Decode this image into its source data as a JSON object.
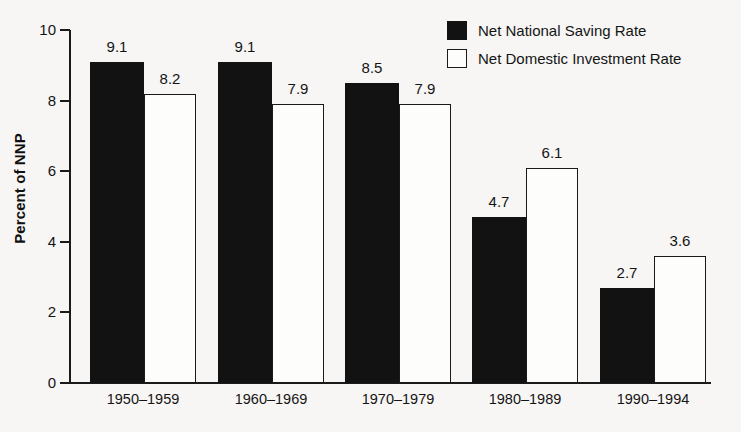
{
  "chart_data": {
    "type": "bar",
    "title": "",
    "xlabel": "",
    "ylabel": "Percent of NNP",
    "ylim": [
      0,
      10
    ],
    "yticks": [
      0,
      2,
      4,
      6,
      8,
      10
    ],
    "grid": false,
    "legend_position": "top-right",
    "categories": [
      "1950–1959",
      "1960–1969",
      "1970–1979",
      "1980–1989",
      "1990–1994"
    ],
    "series": [
      {
        "name": "Net National Saving Rate",
        "style": "filled-black",
        "values": [
          9.1,
          9.1,
          8.5,
          4.7,
          2.7
        ],
        "labels": [
          "9.1",
          "9.1",
          "8.5",
          "4.7",
          "2.7"
        ]
      },
      {
        "name": "Net Domestic Investment Rate",
        "style": "hollow-white",
        "values": [
          8.2,
          7.9,
          7.9,
          6.1,
          3.6
        ],
        "labels": [
          "8.2",
          "7.9",
          "7.9",
          "6.1",
          "3.6"
        ]
      }
    ]
  },
  "axis": {
    "y_tick_labels": [
      "10",
      "8",
      "6",
      "4",
      "2",
      "0"
    ],
    "y_title": "Percent of NNP"
  },
  "legend": {
    "items": [
      {
        "label": "Net National Saving Rate",
        "swatch": "filled"
      },
      {
        "label": "Net Domestic Investment Rate",
        "swatch": "hollow"
      }
    ]
  },
  "colors": {
    "series_1": "#121212",
    "series_2": "#ffffff",
    "axis": "#1a1a1a",
    "text": "#141414",
    "background": "#f7f6f4"
  }
}
